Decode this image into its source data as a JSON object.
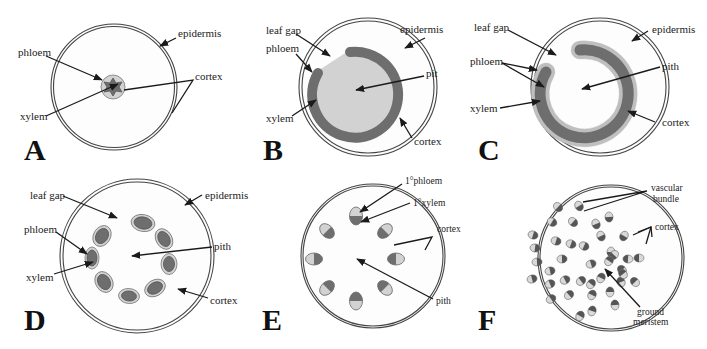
{
  "figure": {
    "colors": {
      "xylem": "#6e6e6e",
      "phloem": "#d2d2d2",
      "background": "#ffffff",
      "outline": "#444444"
    },
    "panels": [
      {
        "letter": "A",
        "labels": {
          "epidermis": "epidermis",
          "phloem": "phloem",
          "xylem": "xylem",
          "cortex": "cortex"
        }
      },
      {
        "letter": "B",
        "labels": {
          "leaf_gap": "leaf gap",
          "epidermis": "epidermis",
          "phloem": "phloem",
          "pith": "pit",
          "xylem": "xylem",
          "cortex": "cortex"
        }
      },
      {
        "letter": "C",
        "labels": {
          "leaf_gap": "leaf gap",
          "epidermis": "epidermis",
          "phloem": "phloem",
          "pith": "pith",
          "xylem": "xylem",
          "cortex": "cortex"
        }
      },
      {
        "letter": "D",
        "labels": {
          "leaf_gap": "leaf gap",
          "epidermis": "epidermis",
          "phloem": "phloem",
          "pith": "pith",
          "xylem": "xylem",
          "cortex": "cortex"
        }
      },
      {
        "letter": "E",
        "labels": {
          "primary_phloem": "1°phloem",
          "primary_xylem": "1°xylem",
          "cortex": "cortex",
          "pith": "pith"
        }
      },
      {
        "letter": "F",
        "labels": {
          "vascular_bundle_line1": "vascular",
          "vascular_bundle_line2": "bundle",
          "cortex": "cortex",
          "ground_meristem_line1": "ground",
          "ground_meristem_line2": "meristem"
        }
      }
    ]
  }
}
